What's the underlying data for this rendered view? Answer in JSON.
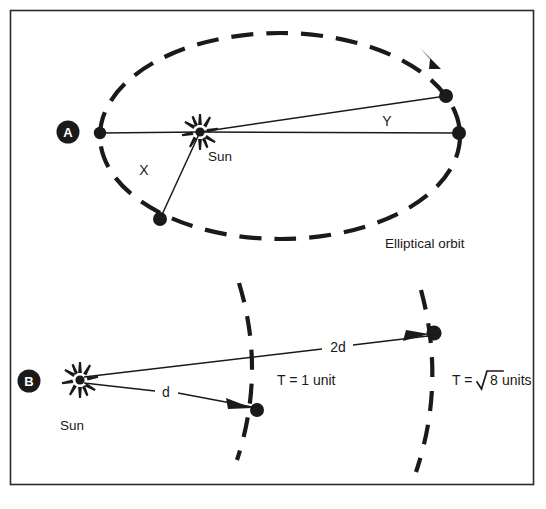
{
  "figure": {
    "background_color": "#ffffff",
    "ink_color": "#1a1a1a",
    "border": {
      "color": "#2b2b2b",
      "x": 10,
      "y": 10,
      "width": 524,
      "height": 475
    }
  },
  "panel_a": {
    "badge_label": "A",
    "sun_label": "Sun",
    "area_x_label": "X",
    "area_y_label": "Y",
    "orbit_caption": "Elliptical orbit",
    "ellipse": {
      "center_x": 280,
      "center_y": 136,
      "radius_x": 180,
      "radius_y": 103,
      "style": "dashed",
      "direction": "counterclockwise"
    },
    "sun_position": {
      "x": 200,
      "y": 132
    },
    "planet_points": [
      {
        "name": "aphelion-left",
        "x": 100,
        "y": 133
      },
      {
        "name": "sweep-x-outer",
        "x": 160,
        "y": 219
      },
      {
        "name": "sweep-y-upper",
        "x": 446,
        "y": 96
      },
      {
        "name": "perihelion-right",
        "x": 459,
        "y": 133
      }
    ]
  },
  "panel_b": {
    "badge_label": "B",
    "sun_label": "Sun",
    "distance_near_label": "d",
    "distance_far_label": "2d",
    "period_near_label": "T = 1 unit",
    "period_far_prefix": "T = ",
    "period_far_radicand": "8",
    "period_far_suffix": " units",
    "sun_position": {
      "x": 80,
      "y": 380
    },
    "near_orbit_point": {
      "x": 257,
      "y": 410
    },
    "far_orbit_point": {
      "x": 434,
      "y": 333
    },
    "arcs": [
      {
        "name": "near-orbit-arc",
        "style": "dashed"
      },
      {
        "name": "far-orbit-arc",
        "style": "dashed"
      }
    ]
  },
  "icons": {
    "sun_icon": "sun-starburst-icon",
    "badge_icon": "circular-label-badge",
    "arrow_icon": "direction-arrowhead"
  }
}
